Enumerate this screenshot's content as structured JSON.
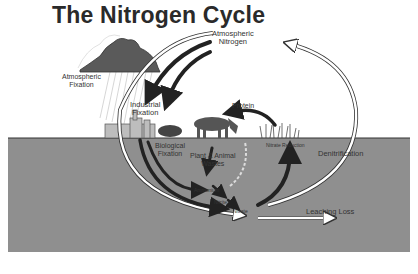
{
  "title": "The Nitrogen Cycle",
  "labels": {
    "atmospheric_nitrogen_1": "Atmospheric",
    "atmospheric_nitrogen_2": "Nitrogen",
    "atmospheric_fixation_1": "Atmospheric",
    "atmospheric_fixation_2": "Fixation",
    "industrial_fixation_1": "Industrial",
    "industrial_fixation_2": "Fixation",
    "protein": "Protein",
    "biological_fixation_1": "Biological",
    "biological_fixation_2": "Fixation",
    "plant_animal_wastes_1": "Plant & Animal",
    "plant_animal_wastes_2": "Wastes",
    "nitrate_reduction": "Nitrate Reduction",
    "denitrification": "Denitrification",
    "ammonium": "Ammonium",
    "nitrite": "Nitrite",
    "nitrate": "Nitrate",
    "leaching_loss": "Leaching Loss"
  },
  "colors": {
    "soil": "#8f8f8f",
    "ink": "#222222",
    "cloud": "#5a5a5a",
    "background": "#ffffff"
  }
}
